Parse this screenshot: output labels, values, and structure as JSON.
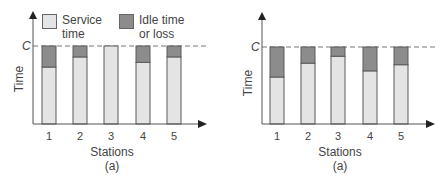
{
  "colors": {
    "service": "#e4e4e4",
    "idle": "#8c8c8c",
    "border": "#5a5a5a",
    "axis": "#555555"
  },
  "legend": {
    "service_line1": "Service",
    "service_line2": "time",
    "idle_line1": "Idle time",
    "idle_line2": "or loss"
  },
  "left": {
    "ylabel": "Time",
    "c_label": "C",
    "xlabel": "Stations",
    "sublabel": "(a)",
    "ticks": [
      "1",
      "2",
      "3",
      "4",
      "5"
    ]
  },
  "right": {
    "ylabel": "Time",
    "c_label": "C",
    "xlabel": "Stations",
    "sublabel": "(a)",
    "ticks": [
      "1",
      "2",
      "3",
      "4",
      "5"
    ]
  },
  "chart_data": [
    {
      "type": "bar",
      "stacked": true,
      "title": "",
      "xlabel": "Stations",
      "ylabel": "Time",
      "caption": "(a)",
      "categories": [
        "1",
        "2",
        "3",
        "4",
        "5"
      ],
      "reference_line": {
        "label": "C",
        "value": 1.0,
        "style": "dashed"
      },
      "series": [
        {
          "name": "Service time",
          "values": [
            0.73,
            0.86,
            1.0,
            0.79,
            0.86
          ]
        },
        {
          "name": "Idle time or loss",
          "values": [
            0.27,
            0.14,
            0.0,
            0.21,
            0.14
          ]
        }
      ],
      "ylim": [
        0,
        1.15
      ],
      "grid": false,
      "legend_position": "top"
    },
    {
      "type": "bar",
      "stacked": true,
      "title": "",
      "xlabel": "Stations",
      "ylabel": "Time",
      "caption": "(a)",
      "categories": [
        "1",
        "2",
        "3",
        "4",
        "5"
      ],
      "reference_line": {
        "label": "C",
        "value": 1.0,
        "style": "dashed"
      },
      "series": [
        {
          "name": "Service time",
          "values": [
            0.61,
            0.79,
            0.88,
            0.69,
            0.77
          ]
        },
        {
          "name": "Idle time or loss",
          "values": [
            0.39,
            0.21,
            0.12,
            0.31,
            0.23
          ]
        }
      ],
      "ylim": [
        0,
        1.15
      ],
      "grid": false,
      "legend_position": "none"
    }
  ]
}
